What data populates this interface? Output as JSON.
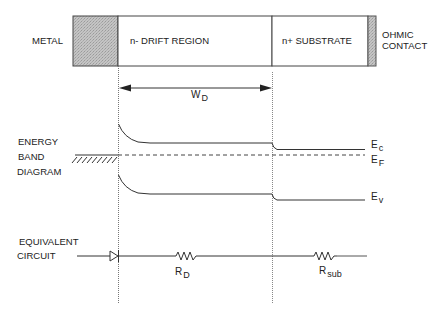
{
  "structure": {
    "metal_label": "METAL",
    "drift_label": "n- DRIFT REGION",
    "substrate_label": "n+ SUBSTRATE",
    "ohmic_label_line1": "OHMIC",
    "ohmic_label_line2": "CONTACT"
  },
  "width_marker": {
    "symbol": "W",
    "subscript": "D"
  },
  "energy_band": {
    "title_line1": "ENERGY",
    "title_line2": "BAND",
    "title_line3": "DIAGRAM",
    "ec_symbol": "E",
    "ec_sub": "c",
    "ef_symbol": "E",
    "ef_sub": "F",
    "ev_symbol": "E",
    "ev_sub": "v"
  },
  "circuit": {
    "title_line1": "EQUIVALENT",
    "title_line2": "CIRCUIT",
    "rd_symbol": "R",
    "rd_sub": "D",
    "rsub_symbol": "R",
    "rsub_sub": "sub"
  },
  "colors": {
    "line": "#333333",
    "metal_fill": "#b8b8b8",
    "contact_fill": "#bdbdbd"
  }
}
